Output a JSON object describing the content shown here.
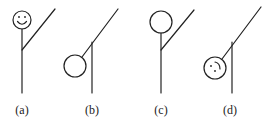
{
  "figure": {
    "stroke_color": "#222222",
    "background": "#ffffff",
    "panels": [
      {
        "id": "a",
        "label": "(a)",
        "description": "upright figure with smiling face, arm raised"
      },
      {
        "id": "b",
        "label": "(b)",
        "description": "pole with diagonal arm, blank circle hanging low on the left"
      },
      {
        "id": "c",
        "label": "(c)",
        "description": "upright figure with blank head, arm raised"
      },
      {
        "id": "d",
        "label": "(d)",
        "description": "pole with diagonal arm, rotated face circle with dots and arc hanging low on the left"
      }
    ]
  }
}
